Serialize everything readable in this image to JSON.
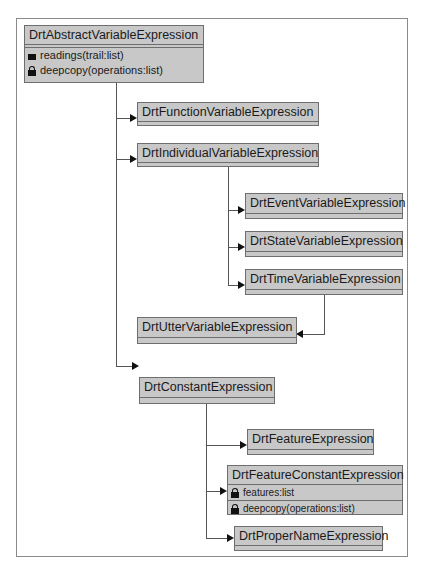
{
  "diagram": {
    "type": "UML class hierarchy",
    "classes": {
      "abstract_var": {
        "name": "DrtAbstractVariableExpression",
        "members": [
          {
            "icon": "square-icon",
            "text": "readings(trail:list)"
          },
          {
            "icon": "lock-icon",
            "text": "deepcopy(operations:list)"
          }
        ]
      },
      "function_var": {
        "name": "DrtFunctionVariableExpression"
      },
      "individual_var": {
        "name": "DrtIndividualVariableExpression"
      },
      "event_var": {
        "name": "DrtEventVariableExpression"
      },
      "state_var": {
        "name": "DrtStateVariableExpression"
      },
      "time_var": {
        "name": "DrtTimeVariableExpression"
      },
      "utter_var": {
        "name": "DrtUtterVariableExpression"
      },
      "constant": {
        "name": "DrtConstantExpression"
      },
      "feature": {
        "name": "DrtFeatureExpression"
      },
      "feature_constant": {
        "name": "DrtFeatureConstantExpression",
        "members": [
          {
            "icon": "lock-icon",
            "text": "features:list"
          },
          {
            "icon": "lock-icon",
            "text": "deepcopy(operations:list)"
          }
        ]
      },
      "proper_name": {
        "name": "DrtProperNameExpression"
      }
    },
    "edges": [
      {
        "from": "DrtAbstractVariableExpression",
        "to": "DrtFunctionVariableExpression"
      },
      {
        "from": "DrtAbstractVariableExpression",
        "to": "DrtIndividualVariableExpression"
      },
      {
        "from": "DrtIndividualVariableExpression",
        "to": "DrtEventVariableExpression"
      },
      {
        "from": "DrtIndividualVariableExpression",
        "to": "DrtStateVariableExpression"
      },
      {
        "from": "DrtIndividualVariableExpression",
        "to": "DrtTimeVariableExpression"
      },
      {
        "from": "DrtTimeVariableExpression",
        "to": "DrtUtterVariableExpression"
      },
      {
        "from": "DrtAbstractVariableExpression",
        "to": "DrtConstantExpression"
      },
      {
        "from": "DrtConstantExpression",
        "to": "DrtFeatureExpression"
      },
      {
        "from": "DrtConstantExpression",
        "to": "DrtFeatureConstantExpression"
      },
      {
        "from": "DrtConstantExpression",
        "to": "DrtProperNameExpression"
      }
    ],
    "colors": {
      "box_fill": "#c8c8c8",
      "box_border": "#6e6e6e",
      "line": "#555555",
      "frame": "#8a8a8a"
    }
  }
}
